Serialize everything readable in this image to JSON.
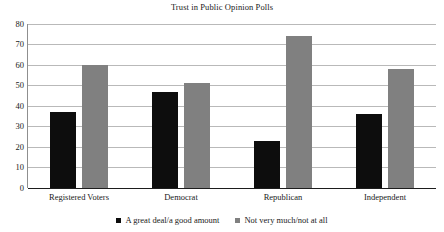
{
  "chart_data": {
    "type": "bar",
    "title": "Trust in Public Opinion Polls",
    "xlabel": "",
    "ylabel": "",
    "ylim": [
      0,
      80
    ],
    "ytick_step": 10,
    "yticks": [
      0,
      10,
      20,
      30,
      40,
      50,
      60,
      70,
      80
    ],
    "grid": true,
    "legend_position": "bottom",
    "categories": [
      "Registered Voters",
      "Democrat",
      "Republican",
      "Independent"
    ],
    "series": [
      {
        "name": "A great deal/a good amount",
        "color": "#0d0d0d",
        "values": [
          37,
          47,
          23,
          36
        ]
      },
      {
        "name": "Not very much/not at all",
        "color": "#808080",
        "values": [
          60,
          51,
          74,
          58
        ]
      }
    ]
  },
  "legend": {
    "items": [
      {
        "label": "A great deal/a good amount"
      },
      {
        "label": "Not very much/not at all"
      }
    ]
  }
}
